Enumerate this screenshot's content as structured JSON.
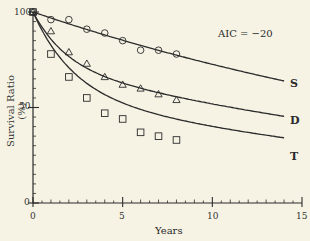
{
  "chart_data": {
    "type": "line",
    "title": "",
    "annotation": "AIC = −20",
    "xlabel": "Years",
    "ylabel": "Survival Ratio (%)",
    "xlim": [
      0,
      15
    ],
    "ylim": [
      0,
      100
    ],
    "x_ticks": [
      "0",
      "5",
      "10",
      "15"
    ],
    "y_ticks": [
      "0",
      "50",
      "100"
    ],
    "grid": false,
    "legend": "inline curve labels at right end",
    "x": [
      0,
      1,
      2,
      3,
      4,
      5,
      6,
      7,
      8
    ],
    "series": [
      {
        "name": "S",
        "marker": "circle",
        "values": [
          100,
          96,
          96,
          91,
          89,
          85,
          80,
          80,
          78
        ],
        "fit_end": {
          "x": 14,
          "y": 64
        }
      },
      {
        "name": "D",
        "marker": "triangle",
        "values": [
          100,
          90,
          79,
          73,
          66,
          62,
          60,
          57,
          54
        ],
        "fit_end": {
          "x": 14,
          "y": 43
        }
      },
      {
        "name": "T",
        "marker": "square",
        "values": [
          100,
          78,
          66,
          55,
          47,
          44,
          37,
          35,
          33
        ],
        "fit_end": {
          "x": 14,
          "y": 27
        }
      }
    ]
  }
}
